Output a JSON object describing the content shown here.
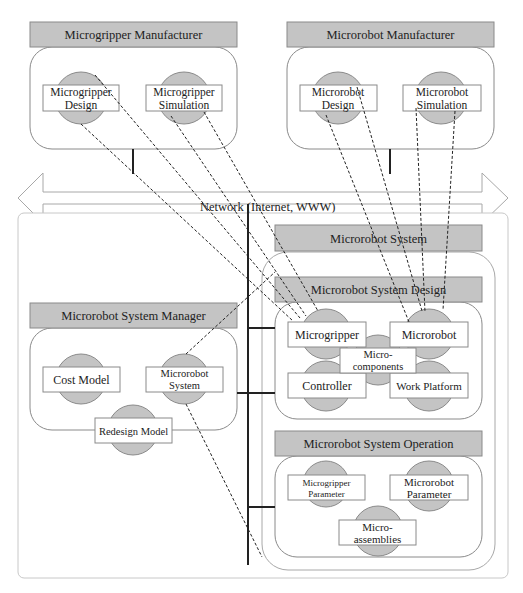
{
  "network": {
    "label": "Network (Internet, WWW)"
  },
  "micrograpper_manufacturer": {
    "title": "Microgripper Manufacturer",
    "components": [
      {
        "line1": "Microgripper",
        "line2": "Design"
      },
      {
        "line1": "Microgripper",
        "line2": "Simulation"
      }
    ]
  },
  "microrobot_manufacturer": {
    "title": "Microrobot Manufacturer",
    "components": [
      {
        "line1": "Microrobot",
        "line2": "Design"
      },
      {
        "line1": "Microrobot",
        "line2": "Simulation"
      }
    ]
  },
  "system_manager": {
    "title": "Microrobot System  Manager",
    "components": [
      {
        "line1": "Cost Model"
      },
      {
        "line1": "Microrobot",
        "line2": "System"
      },
      {
        "line1": "Redesign Model"
      }
    ]
  },
  "microrobot_system": {
    "title": "Microrobot  System",
    "design": {
      "title": "Microrobot System  Design",
      "components": [
        {
          "line1": "Microgripper"
        },
        {
          "line1": "Microrobot"
        },
        {
          "line1": "Micro-",
          "line2": "components"
        },
        {
          "line1": "Controller"
        },
        {
          "line1": "Work Platform"
        }
      ]
    },
    "operation": {
      "title": "Microrobot System  Operation",
      "components": [
        {
          "line1": "Microgripper",
          "line2": "Parameter"
        },
        {
          "line1": "Microrobot",
          "line2": "Parameter"
        },
        {
          "line1": "Micro-",
          "line2": "assemblies"
        }
      ]
    }
  },
  "colors": {
    "header_fill": "#c4c4c4",
    "component_circle": "#c4c4c4",
    "outline": "#8a8a8a",
    "line": "#222222"
  }
}
